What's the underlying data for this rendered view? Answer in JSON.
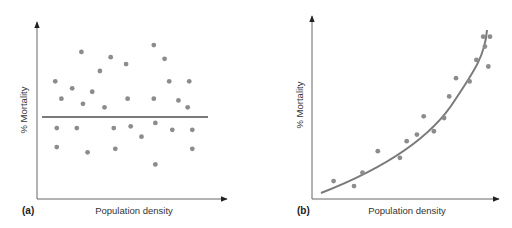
{
  "chart_data": [
    {
      "type": "scatter",
      "panel_label": "(a)",
      "title": "",
      "xlabel": "Population density",
      "ylabel": "% Mortality",
      "xlim": [
        0,
        100
      ],
      "ylim": [
        0,
        100
      ],
      "grid": false,
      "ticks": "none",
      "trend": {
        "type": "horizontal-line",
        "y": 53
      },
      "points": [
        [
          6,
          68
        ],
        [
          10,
          58
        ],
        [
          17,
          64
        ],
        [
          23,
          85
        ],
        [
          24,
          55
        ],
        [
          30,
          62
        ],
        [
          35,
          74
        ],
        [
          38,
          53
        ],
        [
          42,
          82
        ],
        [
          44,
          41
        ],
        [
          52,
          78
        ],
        [
          53,
          58
        ],
        [
          55,
          42
        ],
        [
          62,
          36
        ],
        [
          70,
          89
        ],
        [
          70,
          58
        ],
        [
          71,
          44
        ],
        [
          77,
          81
        ],
        [
          80,
          68
        ],
        [
          82,
          40
        ],
        [
          86,
          57
        ],
        [
          92,
          53
        ],
        [
          93,
          68
        ],
        [
          95,
          40
        ],
        [
          7,
          41
        ],
        [
          20,
          41
        ],
        [
          7,
          30
        ],
        [
          27,
          27
        ],
        [
          45,
          29
        ],
        [
          95,
          29
        ],
        [
          71,
          20
        ]
      ]
    },
    {
      "type": "scatter",
      "panel_label": "(b)",
      "title": "",
      "xlabel": "Population density",
      "ylabel": "% Mortality",
      "xlim": [
        0,
        100
      ],
      "ylim": [
        0,
        100
      ],
      "grid": false,
      "ticks": "none",
      "trend": {
        "type": "exponential-curve",
        "from": [
          5,
          5
        ],
        "to": [
          98,
          93
        ]
      },
      "points": [
        [
          8,
          9
        ],
        [
          20,
          6
        ],
        [
          25,
          14
        ],
        [
          34,
          27
        ],
        [
          47,
          23
        ],
        [
          51,
          33
        ],
        [
          57,
          37
        ],
        [
          61,
          48
        ],
        [
          67,
          39
        ],
        [
          73,
          47
        ],
        [
          76,
          60
        ],
        [
          80,
          71
        ],
        [
          88,
          69
        ],
        [
          92,
          82
        ],
        [
          96,
          96
        ],
        [
          97,
          90
        ],
        [
          99,
          78
        ],
        [
          100,
          96
        ]
      ]
    }
  ],
  "figure": {
    "panel_a_label": "(a)",
    "panel_b_label": "(b)",
    "xlabel_a": "Population density",
    "xlabel_b": "Population density",
    "ylabel_a": "% Mortality",
    "ylabel_b": "% Mortality",
    "colors": {
      "axis": "#555555",
      "point": "#8c8c8c",
      "trend": "#7a7a7a"
    }
  }
}
